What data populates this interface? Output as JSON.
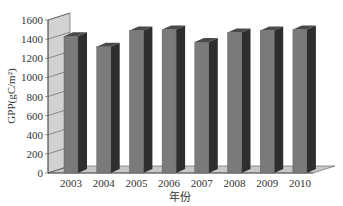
{
  "chart_data": {
    "type": "bar",
    "style": "3d-column",
    "title": "",
    "xlabel": "年份",
    "ylabel": "GPP(gC/m²)",
    "categories": [
      "2003",
      "2004",
      "2005",
      "2006",
      "2007",
      "2008",
      "2009",
      "2010"
    ],
    "values": [
      1430,
      1320,
      1490,
      1500,
      1370,
      1470,
      1490,
      1500
    ],
    "ylim": [
      0,
      1600
    ],
    "yticks": [
      0,
      200,
      400,
      600,
      800,
      1000,
      1200,
      1400,
      1600
    ],
    "grid": false,
    "legend": null,
    "colors": {
      "bar_front": "#7a7a7a",
      "bar_side": "#2e2e2e",
      "bar_top": "#4a4a4a",
      "wall": "#d2d2d2",
      "floor": "#c8c8c8"
    }
  }
}
